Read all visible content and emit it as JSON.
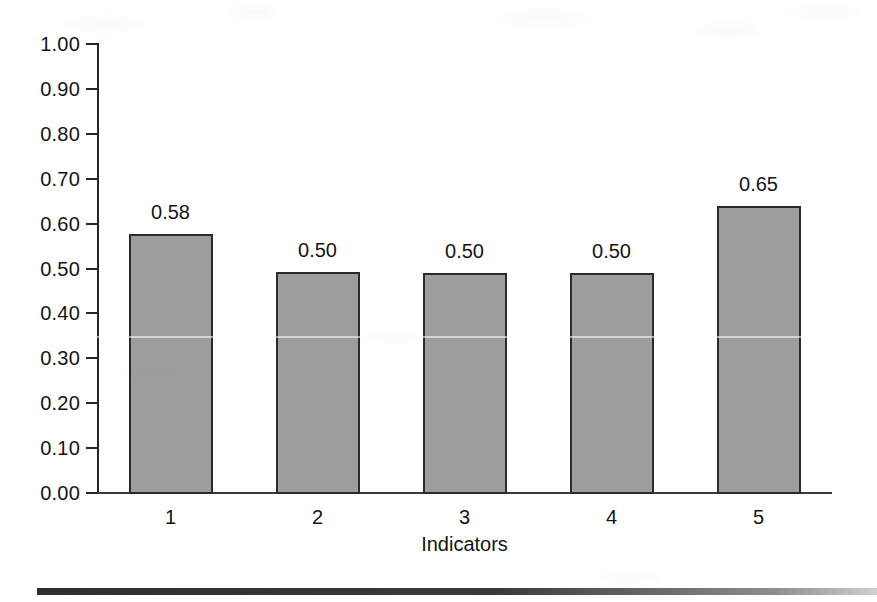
{
  "chart_data": {
    "type": "bar",
    "title": "",
    "subtitle": "",
    "xlabel": "Indicators",
    "ylabel": "",
    "categories": [
      "1",
      "2",
      "3",
      "4",
      "5"
    ],
    "values": [
      0.58,
      0.5,
      0.5,
      0.5,
      0.65
    ],
    "bar_drawn_values": [
      0.577,
      0.492,
      0.49,
      0.49,
      0.64
    ],
    "data_labels": [
      "0.58",
      "0.50",
      "0.50",
      "0.50",
      "0.65"
    ],
    "ylim": [
      0.0,
      1.0
    ],
    "ytick_values": [
      1.0,
      0.9,
      0.8,
      0.7,
      0.6,
      0.5,
      0.4,
      0.3,
      0.2,
      0.1,
      0.0
    ],
    "ytick_labels": [
      "1.00",
      "0.90",
      "0.80",
      "0.70",
      "0.60",
      "0.50",
      "0.40",
      "0.30",
      "0.20",
      "0.10",
      "0.00"
    ],
    "grid": false,
    "legend": null,
    "legend_position": "none",
    "series": [
      {
        "name": "Indicators",
        "values": [
          0.58,
          0.5,
          0.5,
          0.5,
          0.65
        ]
      }
    ],
    "colors": {
      "bar_fill": "#9d9d9d",
      "bar_border": "#2b2b2b",
      "axis": "#262626",
      "text": "#141414",
      "background": "#ffffff",
      "bottom_rule": "#2e2e2e"
    }
  }
}
